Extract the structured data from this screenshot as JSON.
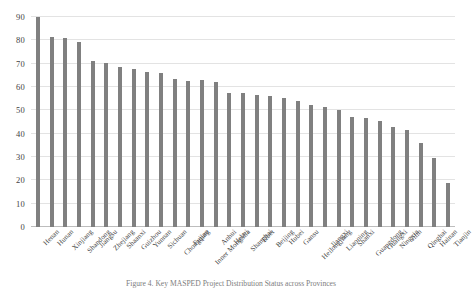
{
  "chart_data": {
    "type": "bar",
    "title": "",
    "xlabel": "",
    "ylabel": "",
    "ylim": [
      0,
      90
    ],
    "yticks": [
      0,
      10,
      20,
      30,
      40,
      50,
      60,
      70,
      80,
      90
    ],
    "grid": true,
    "legend": false,
    "bar_color": "#808080",
    "categories": [
      "Henan",
      "Hunan",
      "Xinjiang",
      "Shandong",
      "Jiangsu",
      "Zhejiang",
      "Shaanxi",
      "Guizhou",
      "Yunnan",
      "Sichuan",
      "Chongqing",
      "Fujian",
      "Inner Mongolia",
      "Anhui",
      "Hebei",
      "Shanghai",
      "Tibet",
      "Beijing",
      "Hubei",
      "Gansu",
      "Heilongjiang",
      "Jiangxi",
      "Liaoning",
      "Shanxi",
      "Guangdong",
      "Guangxi",
      "Ningxia",
      "Jilin",
      "Qinghai",
      "Hainan",
      "Tianjin"
    ],
    "values": [
      90,
      81.5,
      81,
      79.5,
      71,
      70.3,
      68.5,
      67.6,
      66.3,
      66,
      63.6,
      62.5,
      63,
      62.2,
      57.5,
      57.3,
      56.5,
      56.2,
      55.3,
      54,
      52.5,
      51.5,
      50.3,
      47,
      46.8,
      45.5,
      43,
      41.5,
      36,
      29.5,
      19
    ]
  },
  "caption": {
    "text": "Figure 4. Key MASPED Project Distribution Status across Provinces"
  }
}
